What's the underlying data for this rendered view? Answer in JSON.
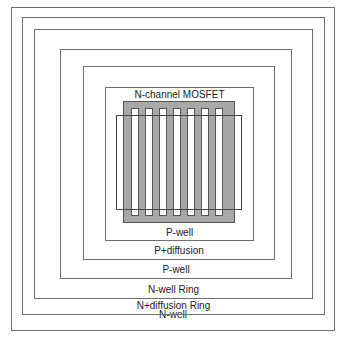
{
  "diagram": {
    "layers": [
      {
        "label": "N-well",
        "name": "n-well"
      },
      {
        "label": "N+diffusion Ring",
        "name": "n-diffusion-ring"
      },
      {
        "label": "N-well Ring",
        "name": "n-well-ring"
      },
      {
        "label": "P-well",
        "name": "p-well-outer"
      },
      {
        "label": "P+diffusion",
        "name": "p-diffusion"
      },
      {
        "label": "P-well",
        "name": "p-well-inner"
      }
    ],
    "device_label": "N-channel MOSFET",
    "finger_count": 7,
    "colors": {
      "diffusion": "#a8a8a8",
      "border": "#6e6e6e"
    }
  }
}
